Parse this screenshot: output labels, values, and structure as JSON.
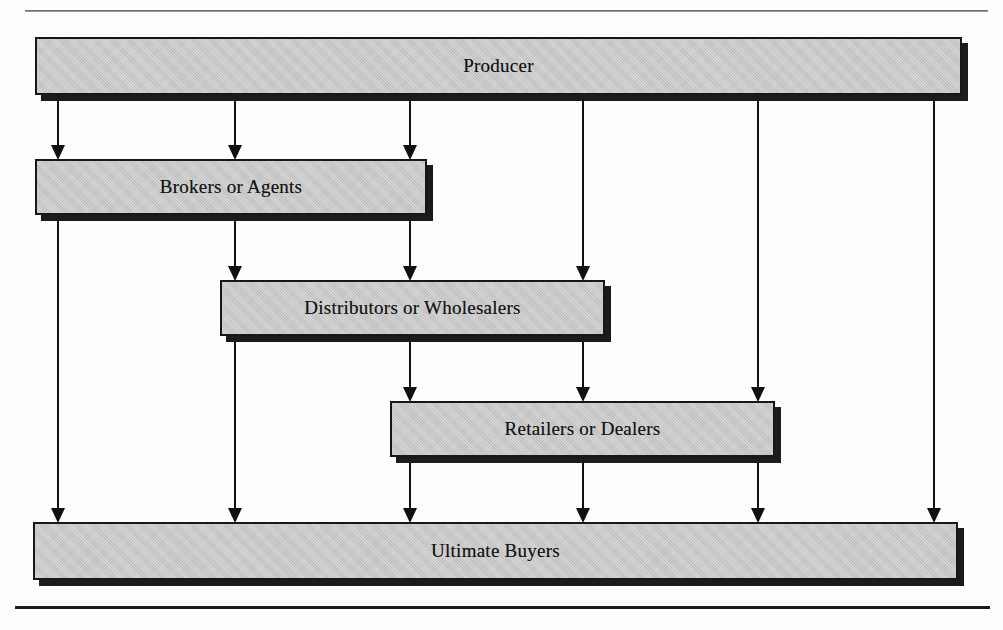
{
  "diagram": {
    "title_sliver": "",
    "canvas": {
      "width": 1003,
      "height": 630,
      "background": "#fefefe"
    },
    "style": {
      "box_fill": "#c6c6c6",
      "box_border": "#171717",
      "box_shadow": "#1b1b1b",
      "line_color": "#101010",
      "rule_color": "#1c1c1c"
    },
    "rules": [
      {
        "name": "top-rule",
        "x": 25,
        "y": 10,
        "width": 963
      },
      {
        "name": "bottom-rule",
        "x": 15,
        "y": 606,
        "width": 975
      }
    ],
    "nodes": [
      {
        "id": "producer",
        "label": "Producer",
        "x": 35,
        "y": 37,
        "width": 927,
        "height": 58,
        "level": 0
      },
      {
        "id": "brokers",
        "label": "Brokers or Agents",
        "x": 35,
        "y": 159,
        "width": 392,
        "height": 56,
        "level": 1
      },
      {
        "id": "distributors",
        "label": "Distributors or Wholesalers",
        "x": 220,
        "y": 280,
        "width": 385,
        "height": 56,
        "level": 2
      },
      {
        "id": "retailers",
        "label": "Retailers or Dealers",
        "x": 390,
        "y": 401,
        "width": 385,
        "height": 56,
        "level": 3
      },
      {
        "id": "buyers",
        "label": "Ultimate Buyers",
        "x": 33,
        "y": 522,
        "width": 925,
        "height": 58,
        "level": 4
      }
    ],
    "channels": [
      {
        "id": "c1",
        "x": 58,
        "from": "producer",
        "to": "brokers",
        "label": "Producer to Brokers or Agents"
      },
      {
        "id": "c2",
        "x": 235,
        "from": "producer",
        "to": "brokers",
        "label": "Producer to Brokers or Agents"
      },
      {
        "id": "c3",
        "x": 410,
        "from": "producer",
        "to": "brokers",
        "label": "Producer to Brokers or Agents"
      },
      {
        "id": "c4",
        "x": 583,
        "from": "producer",
        "to": "distributors",
        "label": "Producer to Distributors or Wholesalers"
      },
      {
        "id": "c5",
        "x": 758,
        "from": "producer",
        "to": "retailers",
        "label": "Producer to Retailers or Dealers"
      },
      {
        "id": "c6",
        "x": 934,
        "from": "producer",
        "to": "buyers",
        "label": "Producer to Ultimate Buyers"
      },
      {
        "id": "c7",
        "x": 58,
        "from": "brokers",
        "to": "buyers",
        "label": "Brokers or Agents to Ultimate Buyers"
      },
      {
        "id": "c8",
        "x": 235,
        "from": "brokers",
        "to": "distributors",
        "label": "Brokers or Agents to Distributors or Wholesalers"
      },
      {
        "id": "c9",
        "x": 410,
        "from": "brokers",
        "to": "distributors",
        "label": "Brokers or Agents to Distributors or Wholesalers"
      },
      {
        "id": "c10",
        "x": 235,
        "from": "distributors",
        "to": "buyers",
        "label": "Distributors or Wholesalers to Ultimate Buyers"
      },
      {
        "id": "c11",
        "x": 410,
        "from": "distributors",
        "to": "retailers",
        "label": "Distributors or Wholesalers to Retailers or Dealers"
      },
      {
        "id": "c12",
        "x": 583,
        "from": "distributors",
        "to": "retailers",
        "label": "Distributors or Wholesalers to Retailers or Dealers"
      },
      {
        "id": "c13",
        "x": 410,
        "from": "retailers",
        "to": "buyers",
        "label": "Retailers or Dealers to Ultimate Buyers"
      },
      {
        "id": "c14",
        "x": 583,
        "from": "retailers",
        "to": "buyers",
        "label": "Retailers or Dealers to Ultimate Buyers"
      },
      {
        "id": "c15",
        "x": 758,
        "from": "retailers",
        "to": "buyers",
        "label": "Retailers or Dealers to Ultimate Buyers"
      }
    ]
  }
}
